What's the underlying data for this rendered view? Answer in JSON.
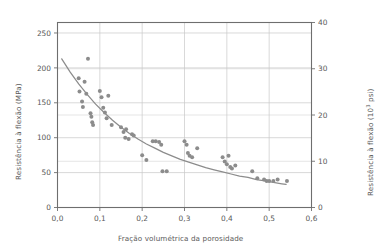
{
  "chart_data": {
    "type": "scatter",
    "title": "",
    "xlabel": "Fração volumétrica da porosidade",
    "ylabel": "Resistência à flexão (MPa)",
    "ylabel_right_prefix": "Resistência à flexão (10",
    "ylabel_right_exponent": "3",
    "ylabel_right_suffix": " psi)",
    "xlim": [
      0.0,
      0.6
    ],
    "ylim": [
      0,
      265
    ],
    "ylim_right": [
      0,
      40
    ],
    "xticks": [
      0.0,
      0.1,
      0.2,
      0.3,
      0.4,
      0.5,
      0.6
    ],
    "xticklabels": [
      "0,0",
      "0,1",
      "0,2",
      "0,3",
      "0,4",
      "0,5",
      "0,6"
    ],
    "yticks": [
      0,
      50,
      100,
      150,
      200,
      250
    ],
    "yticklabels": [
      "0",
      "50",
      "100",
      "150",
      "200",
      "250"
    ],
    "yticks_right": [
      0,
      10,
      20,
      30,
      40
    ],
    "yticklabels_right": [
      "0",
      "10",
      "20",
      "30",
      "40"
    ],
    "grid": true,
    "grid_color": "#c8c8c8",
    "legend": null,
    "marker_color": "#8c8c8c",
    "curve_color": "#8c8c8c",
    "axis_color": "#6e6e6e",
    "points": [
      [
        0.05,
        185
      ],
      [
        0.052,
        166
      ],
      [
        0.058,
        152
      ],
      [
        0.06,
        144
      ],
      [
        0.064,
        180
      ],
      [
        0.068,
        163
      ],
      [
        0.072,
        213
      ],
      [
        0.078,
        135
      ],
      [
        0.08,
        130
      ],
      [
        0.082,
        122
      ],
      [
        0.084,
        118
      ],
      [
        0.1,
        167
      ],
      [
        0.104,
        158
      ],
      [
        0.108,
        143
      ],
      [
        0.112,
        136
      ],
      [
        0.116,
        128
      ],
      [
        0.12,
        160
      ],
      [
        0.128,
        118
      ],
      [
        0.15,
        115
      ],
      [
        0.156,
        108
      ],
      [
        0.16,
        100
      ],
      [
        0.162,
        112
      ],
      [
        0.168,
        98
      ],
      [
        0.176,
        105
      ],
      [
        0.18,
        103
      ],
      [
        0.2,
        75
      ],
      [
        0.21,
        68
      ],
      [
        0.225,
        95
      ],
      [
        0.232,
        95
      ],
      [
        0.24,
        94
      ],
      [
        0.245,
        90
      ],
      [
        0.248,
        52
      ],
      [
        0.258,
        52
      ],
      [
        0.3,
        95
      ],
      [
        0.305,
        90
      ],
      [
        0.308,
        78
      ],
      [
        0.312,
        74
      ],
      [
        0.318,
        72
      ],
      [
        0.33,
        85
      ],
      [
        0.39,
        72
      ],
      [
        0.395,
        66
      ],
      [
        0.4,
        62
      ],
      [
        0.404,
        74
      ],
      [
        0.408,
        58
      ],
      [
        0.412,
        56
      ],
      [
        0.42,
        60
      ],
      [
        0.46,
        52
      ],
      [
        0.472,
        42
      ],
      [
        0.488,
        40
      ],
      [
        0.494,
        38
      ],
      [
        0.5,
        38
      ],
      [
        0.51,
        38
      ],
      [
        0.52,
        40
      ],
      [
        0.542,
        38
      ]
    ],
    "curve": [
      [
        0.01,
        213
      ],
      [
        0.03,
        194
      ],
      [
        0.05,
        177
      ],
      [
        0.07,
        162
      ],
      [
        0.09,
        148
      ],
      [
        0.11,
        136
      ],
      [
        0.13,
        125
      ],
      [
        0.15,
        115
      ],
      [
        0.17,
        106
      ],
      [
        0.19,
        98
      ],
      [
        0.21,
        91
      ],
      [
        0.23,
        85
      ],
      [
        0.25,
        79
      ],
      [
        0.27,
        74
      ],
      [
        0.29,
        69
      ],
      [
        0.31,
        65
      ],
      [
        0.33,
        61
      ],
      [
        0.35,
        57
      ],
      [
        0.37,
        54
      ],
      [
        0.39,
        51
      ],
      [
        0.41,
        48
      ],
      [
        0.43,
        45
      ],
      [
        0.45,
        43
      ],
      [
        0.47,
        40
      ],
      [
        0.49,
        38
      ],
      [
        0.51,
        36
      ],
      [
        0.53,
        34
      ],
      [
        0.54,
        33
      ]
    ]
  }
}
